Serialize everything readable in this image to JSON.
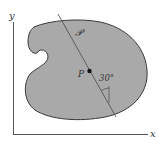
{
  "diagram": {
    "axes": {
      "x_label": "x",
      "y_label": "y"
    },
    "region_label": "𝒫",
    "point_label": "P",
    "angle_label": "30°",
    "colors": {
      "region_fill": "#a9a9a9",
      "region_stroke": "#3a3a3a",
      "axis": "#555555",
      "line": "#555555",
      "point": "#111111"
    }
  }
}
